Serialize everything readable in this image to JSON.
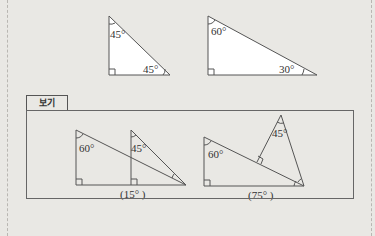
{
  "top_figures": {
    "triangle_1": {
      "angle_top": "45°",
      "angle_bottom": "45°"
    },
    "triangle_2": {
      "angle_top": "60°",
      "angle_bottom": "30°"
    }
  },
  "example_box": {
    "label": "보기",
    "figure_1": {
      "angle_a": "60°",
      "angle_b": "45°",
      "caption": "(15° )"
    },
    "figure_2": {
      "angle_a": "60°",
      "angle_b": "45°",
      "caption": "(75° )"
    }
  },
  "colors": {
    "background": "#e9e8e4",
    "line": "#555555",
    "fill": "#ffffff"
  }
}
